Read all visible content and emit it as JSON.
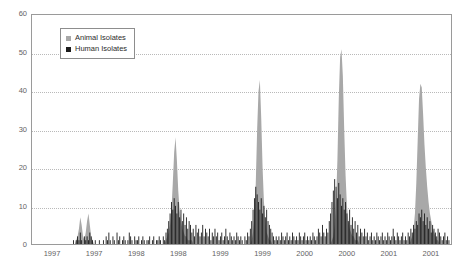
{
  "chart_data": {
    "type": "bar",
    "title": "",
    "subtitle": "",
    "xlabel": "",
    "ylabel": "",
    "ylim": [
      0,
      60
    ],
    "yticks": [
      0,
      10,
      20,
      30,
      40,
      50,
      60
    ],
    "ytick_labels": [
      "0",
      "10",
      "20",
      "30",
      "40",
      "50",
      "60"
    ],
    "grid": true,
    "grid_axis": "y",
    "grid_style": "dotted",
    "legend_position": "upper-left-inside",
    "xtick_labels": [
      "1997",
      "1997",
      "1998",
      "1998",
      "1999",
      "1999",
      "2000",
      "2000",
      "2001",
      "2001"
    ],
    "x_axis_note": "Semi-annual tick labels spanning 1997 through 2001",
    "series": [
      {
        "name": "Animal Isolates",
        "color": "#a8a8a8",
        "render": "area-spikes",
        "values": [
          0,
          0,
          0,
          0,
          0,
          0,
          0,
          0,
          0,
          0,
          0,
          0,
          0,
          0,
          0,
          0,
          0,
          0,
          0,
          0,
          0,
          0,
          0,
          0,
          0,
          0,
          0,
          0,
          0,
          0,
          0,
          0,
          1,
          2,
          4,
          7,
          5,
          2,
          1,
          3,
          6,
          8,
          5,
          2,
          1,
          0,
          0,
          0,
          0,
          0,
          0,
          0,
          0,
          0,
          0,
          0,
          0,
          0,
          0,
          0,
          0,
          0,
          0,
          0,
          0,
          0,
          0,
          0,
          0,
          0,
          0,
          0,
          0,
          0,
          0,
          0,
          0,
          0,
          0,
          0,
          0,
          0,
          0,
          0,
          0,
          0,
          0,
          0,
          0,
          0,
          0,
          0,
          0,
          0,
          0,
          0,
          0,
          0,
          1,
          2,
          3,
          5,
          9,
          16,
          24,
          28,
          22,
          14,
          9,
          6,
          4,
          3,
          2,
          2,
          1,
          1,
          1,
          1,
          0,
          0,
          0,
          0,
          0,
          0,
          0,
          0,
          0,
          0,
          0,
          0,
          0,
          0,
          0,
          0,
          0,
          0,
          0,
          0,
          0,
          0,
          0,
          0,
          0,
          0,
          0,
          0,
          0,
          0,
          0,
          0,
          0,
          0,
          0,
          0,
          0,
          0,
          0,
          0,
          0,
          0,
          0,
          1,
          3,
          7,
          16,
          30,
          40,
          43,
          33,
          20,
          11,
          6,
          3,
          2,
          1,
          1,
          0,
          0,
          0,
          0,
          0,
          0,
          0,
          0,
          0,
          0,
          0,
          0,
          0,
          0,
          0,
          0,
          0,
          0,
          0,
          0,
          0,
          0,
          0,
          0,
          0,
          0,
          0,
          0,
          0,
          0,
          0,
          0,
          0,
          0,
          0,
          0,
          0,
          0,
          0,
          0,
          0,
          0,
          0,
          0,
          1,
          2,
          5,
          11,
          22,
          38,
          49,
          51,
          44,
          30,
          18,
          10,
          6,
          4,
          3,
          2,
          2,
          1,
          1,
          1,
          0,
          0,
          0,
          0,
          0,
          0,
          0,
          0,
          0,
          0,
          0,
          0,
          0,
          0,
          0,
          0,
          0,
          0,
          0,
          0,
          0,
          0,
          0,
          0,
          0,
          0,
          0,
          0,
          0,
          0,
          0,
          0,
          0,
          0,
          0,
          0,
          0,
          0,
          1,
          2,
          4,
          8,
          16,
          27,
          38,
          42,
          41,
          34,
          26,
          20,
          15,
          11,
          8,
          6,
          4,
          3,
          2,
          1,
          1,
          0,
          0,
          0,
          0,
          0,
          0,
          0
        ]
      },
      {
        "name": "Human Isolates",
        "color": "#1c1c1c",
        "render": "bars",
        "values": [
          0,
          0,
          0,
          0,
          0,
          0,
          0,
          0,
          0,
          0,
          0,
          0,
          0,
          0,
          0,
          0,
          0,
          0,
          0,
          0,
          0,
          0,
          0,
          0,
          0,
          0,
          0,
          0,
          0,
          0,
          1,
          0,
          1,
          2,
          1,
          3,
          1,
          0,
          2,
          1,
          2,
          1,
          3,
          2,
          1,
          0,
          1,
          0,
          0,
          1,
          0,
          0,
          1,
          0,
          2,
          1,
          3,
          1,
          0,
          2,
          1,
          0,
          3,
          1,
          2,
          0,
          1,
          2,
          1,
          0,
          1,
          3,
          2,
          1,
          0,
          2,
          1,
          1,
          2,
          0,
          1,
          2,
          1,
          0,
          1,
          1,
          2,
          0,
          1,
          2,
          0,
          1,
          1,
          2,
          1,
          0,
          2,
          1,
          3,
          4,
          6,
          8,
          11,
          9,
          12,
          10,
          8,
          11,
          7,
          9,
          6,
          8,
          5,
          7,
          4,
          6,
          5,
          3,
          4,
          2,
          5,
          3,
          4,
          2,
          3,
          5,
          2,
          4,
          3,
          2,
          4,
          1,
          3,
          2,
          4,
          2,
          3,
          1,
          2,
          3,
          1,
          2,
          4,
          2,
          1,
          3,
          2,
          1,
          2,
          1,
          3,
          2,
          1,
          2,
          1,
          0,
          2,
          1,
          3,
          2,
          4,
          6,
          9,
          12,
          15,
          13,
          11,
          9,
          12,
          8,
          10,
          7,
          9,
          6,
          5,
          4,
          3,
          2,
          1,
          2,
          1,
          2,
          1,
          3,
          2,
          1,
          2,
          3,
          1,
          2,
          1,
          3,
          2,
          1,
          2,
          1,
          3,
          2,
          1,
          2,
          3,
          1,
          2,
          1,
          2,
          1,
          3,
          2,
          1,
          2,
          4,
          3,
          2,
          5,
          3,
          2,
          4,
          3,
          6,
          8,
          11,
          14,
          17,
          15,
          12,
          16,
          13,
          10,
          12,
          9,
          11,
          8,
          6,
          9,
          5,
          7,
          4,
          6,
          3,
          5,
          2,
          4,
          3,
          2,
          4,
          2,
          3,
          1,
          2,
          3,
          1,
          2,
          1,
          3,
          2,
          1,
          2,
          3,
          1,
          2,
          1,
          3,
          2,
          1,
          2,
          4,
          2,
          1,
          3,
          2,
          1,
          2,
          3,
          1,
          2,
          1,
          3,
          2,
          4,
          3,
          5,
          4,
          6,
          5,
          8,
          7,
          9,
          6,
          8,
          5,
          7,
          4,
          6,
          3,
          5,
          4,
          3,
          2,
          4,
          3,
          2,
          1,
          2,
          3,
          1,
          2,
          1,
          0
        ]
      }
    ]
  },
  "legend": {
    "items": [
      {
        "label": "Animal Isolates",
        "color": "#a8a8a8"
      },
      {
        "label": "Human Isolates",
        "color": "#1c1c1c"
      }
    ]
  }
}
